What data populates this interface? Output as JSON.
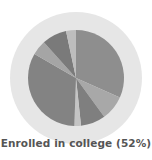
{
  "chart_data": {
    "type": "pie",
    "title": "",
    "caption": "Enrolled in college (52%)",
    "slices": [
      {
        "index": 1,
        "start_deg": 0,
        "end_deg": 114,
        "color": "#8e8e8e"
      },
      {
        "index": 2,
        "start_deg": 114,
        "end_deg": 144,
        "color": "#a8a8a8"
      },
      {
        "index": 3,
        "start_deg": 144,
        "end_deg": 174,
        "color": "#7f7f7f"
      },
      {
        "index": 4,
        "start_deg": 174,
        "end_deg": 182,
        "color": "#c4c4c4"
      },
      {
        "index": 5,
        "start_deg": 182,
        "end_deg": 300,
        "color": "#838383"
      },
      {
        "index": 6,
        "start_deg": 300,
        "end_deg": 318,
        "color": "#a5a5a5"
      },
      {
        "index": 7,
        "start_deg": 318,
        "end_deg": 348,
        "color": "#7a7a7a"
      },
      {
        "index": 8,
        "start_deg": 348,
        "end_deg": 360,
        "color": "#bdbdbd"
      }
    ],
    "ring_color": "#e6e6e6",
    "legend": []
  }
}
